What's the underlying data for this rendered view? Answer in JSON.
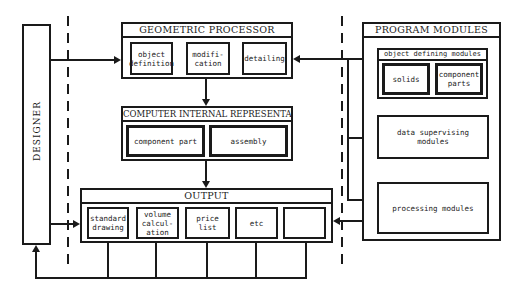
{
  "designer": {
    "label": "DESIGNER"
  },
  "geometric_processor": {
    "title": "GEOMETRIC PROCESSOR",
    "items": [
      "object\ndefinition",
      "modifi-\ncation",
      "detailing"
    ]
  },
  "internal_representation": {
    "title": "COMPUTER INTERNAL REPRESENTATION",
    "items": [
      "component part",
      "assembly"
    ]
  },
  "output": {
    "title": "OUTPUT",
    "items": [
      "standard\ndrawing",
      "volume\ncalcul-\nation",
      "price\nlist",
      "etc",
      ""
    ]
  },
  "program_modules": {
    "title": "PROGRAM MODULES",
    "object_defining": {
      "title": "object defining modules",
      "items": [
        "solids",
        "component\nparts"
      ]
    },
    "data_supervising": "data supervising\nmodules",
    "processing": "processing modules"
  },
  "colors": {
    "ink": "#1a1a1a",
    "background": "#ffffff"
  }
}
